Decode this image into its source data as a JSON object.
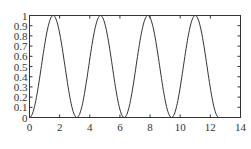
{
  "chart_data": {
    "type": "line",
    "title": "",
    "xlabel": "",
    "ylabel": "",
    "xlim": [
      0,
      14
    ],
    "ylim": [
      0,
      1
    ],
    "grid": false,
    "legend": null,
    "x_ticks": [
      "0",
      "2",
      "4",
      "6",
      "8",
      "10",
      "12",
      "14"
    ],
    "y_ticks": [
      "0",
      "0.1",
      "0.2",
      "0.3",
      "0.4",
      "0.5",
      "0.6",
      "0.7",
      "0.8",
      "0.9",
      "1"
    ],
    "series": [
      {
        "name": "sin^2(x)",
        "function": "sin(x)^2",
        "x_range": [
          0,
          12.57
        ],
        "color": "#333333",
        "x": [
          0,
          0.785,
          1.571,
          2.356,
          3.142,
          3.927,
          4.712,
          5.498,
          6.283,
          7.069,
          7.854,
          8.639,
          9.425,
          10.21,
          10.996,
          11.781,
          12.566
        ],
        "values": [
          0,
          0.5,
          1,
          0.5,
          0,
          0.5,
          1,
          0.5,
          0,
          0.5,
          1,
          0.5,
          0,
          0.5,
          1,
          0.5,
          0
        ]
      }
    ]
  },
  "plot": {
    "line_color": "#333333",
    "axis_color": "#333333",
    "background": "#ffffff"
  }
}
